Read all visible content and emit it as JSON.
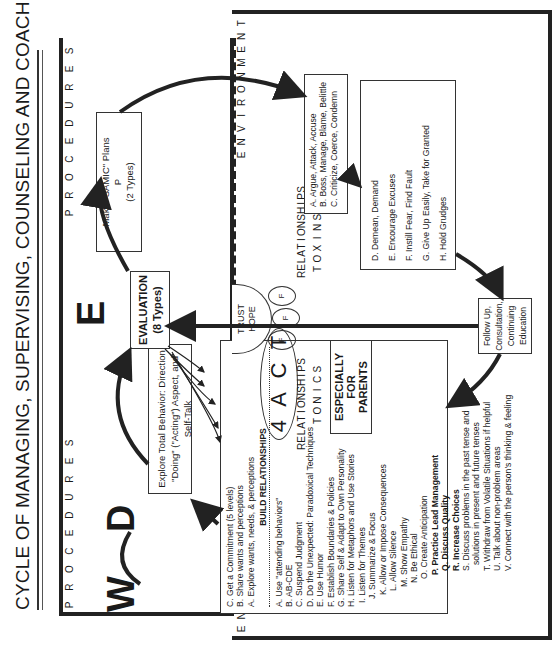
{
  "title": "CYCLE OF MANAGING, SUPERVISING, COUNSELING AND COACHING",
  "regions": {
    "procedures_label": "PROCEDURES",
    "environment_label": "ENVIRONMENT"
  },
  "stages": {
    "W": {
      "letter": "W",
      "items": [
        "C. Get a Commitment (5 levels)",
        "B. Share wants and perceptions",
        "A. Explore wants, needs, & perceptions"
      ]
    },
    "D": {
      "letter": "D",
      "lines": [
        "Explore Total Behavior: Direction",
        "\"Doing\" (\"Acting\") Aspect, and Self-Talk"
      ]
    },
    "E": {
      "letter": "E",
      "box_line1": "EVALUATION",
      "box_line2": "(8 Types)"
    },
    "P": {
      "letter": "P",
      "lines": [
        "Make \"SAMIC\" Plans",
        "P",
        "(2 Types)"
      ]
    }
  },
  "build_relationships": {
    "header": "BUILD RELATIONSHIPS",
    "items": [
      "A. Use \"attending behaviors\"",
      "B. AB-CDE",
      "C. Suspend Judgment",
      "D. Do the Unexpected: Paradoxical Techniques",
      "E. Use Humor",
      "F. Establish Boundaries & Policies",
      "G. Share Self & Adapt to Own Personality",
      "H. Listen for Metaphors and Use Stories",
      "I. Listen for Themes",
      "J. Summarize & Focus",
      "K. Allow or Impose Consequences",
      "L. Allow Silence",
      "M. Show Empathy",
      "N. Be Ethical",
      "O. Create Anticipation",
      "P. Practice Lead Management",
      "Q. Discuss Quality",
      "R. Increase Choices",
      "S. Discuss problems in the past tense and",
      "solutions in present and future tenses",
      "T. Withdraw from Volatile Situations if helpful",
      "U. Talk about non-problem areas",
      "V. Connect with the person's thinking & feeling"
    ],
    "bold_indices": [
      15,
      16,
      17
    ]
  },
  "act": {
    "oval": [
      "4",
      "A",
      "C",
      "T"
    ],
    "parents_label": [
      "ESPECIALLY",
      "FOR",
      "PARENTS"
    ]
  },
  "trust_hope": {
    "line1": "TRUST",
    "line2": "HOPE",
    "petals": [
      "F",
      "F",
      "F"
    ]
  },
  "toxins": {
    "top_label": "RELATIONSHIP TOXINS",
    "bottom_label": "RELATIONSHIP TONICS",
    "box1": [
      "A. Argue, Attack, Accuse",
      "B. Boss, Manage, Blame, Belittle",
      "C. Criticize, Coerce, Condemn"
    ],
    "box2": [
      "D. Demean, Demand",
      "E. Encourage Excuses",
      "F. Instill Fear, Find Fault",
      "G. Give Up Easily, Take for Granted",
      "H. Hold Grudges"
    ]
  },
  "follow_up": {
    "lines": [
      "Follow Up,",
      "Consultation,",
      "Continuing",
      "Education"
    ]
  }
}
